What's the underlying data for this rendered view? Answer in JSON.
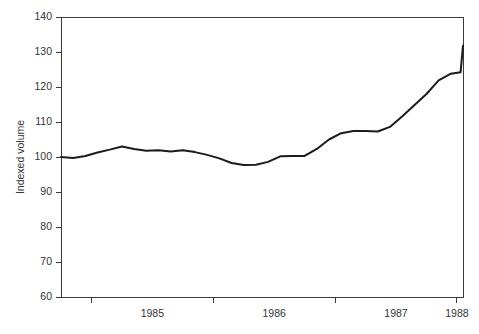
{
  "chart_data": {
    "type": "line",
    "title": "",
    "subtitle": "",
    "xlabel": "",
    "ylabel": "Indexed volume",
    "xlim": [
      1984.75,
      1988.05
    ],
    "ylim": [
      60,
      140
    ],
    "grid": false,
    "legend": null,
    "y_ticks": [
      60,
      70,
      80,
      90,
      100,
      110,
      120,
      130,
      140
    ],
    "y_tick_labels": [
      "60",
      "70",
      "80",
      "90",
      "100",
      "110",
      "120",
      "130",
      "140"
    ],
    "x_tick_positions": [
      1985.0,
      1986.0,
      1987.0,
      1988.0
    ],
    "x_tick_labels": [
      "1985",
      "1986",
      "1987",
      "1988"
    ],
    "x_label_positions": [
      1985.5,
      1986.5,
      1987.5,
      1988.0
    ],
    "series": [
      {
        "name": "Indexed volume",
        "color": "#1b1b1b",
        "x": [
          1984.75,
          1984.85,
          1984.95,
          1985.05,
          1985.15,
          1985.25,
          1985.35,
          1985.45,
          1985.55,
          1985.65,
          1985.75,
          1985.85,
          1985.95,
          1986.05,
          1986.15,
          1986.25,
          1986.35,
          1986.45,
          1986.55,
          1986.65,
          1986.75,
          1986.85,
          1986.95,
          1987.05,
          1987.15,
          1987.25,
          1987.35,
          1987.45,
          1987.55,
          1987.65,
          1987.75,
          1987.85,
          1987.95,
          1988.03
        ],
        "y": [
          100.0,
          99.7,
          100.3,
          101.3,
          102.1,
          103.0,
          102.3,
          101.8,
          101.9,
          101.6,
          101.9,
          101.4,
          100.6,
          99.6,
          98.3,
          97.7,
          97.8,
          98.6,
          100.2,
          100.3,
          100.3,
          102.3,
          105.0,
          106.8,
          107.4,
          107.4,
          107.3,
          108.6,
          111.6,
          114.8,
          118.0,
          121.9,
          123.8,
          124.2
        ]
      }
    ],
    "series_tail": {
      "x": [
        1988.03,
        1988.05
      ],
      "y": [
        124.2,
        131.8
      ]
    }
  },
  "axis": {
    "y_title": "Indexed volume"
  }
}
